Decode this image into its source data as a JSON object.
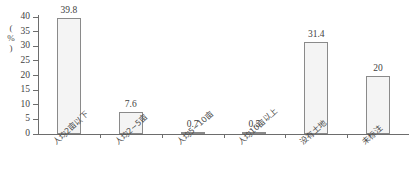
{
  "chart_data": {
    "type": "bar",
    "title": "",
    "subtitle": "",
    "xlabel": "",
    "ylabel": "(%)",
    "ylim": [
      0,
      40
    ],
    "ytick_labels": [
      "40",
      "35",
      "30",
      "25",
      "20",
      "15",
      "10",
      "5",
      "0"
    ],
    "ytick_values": [
      40,
      35,
      30,
      25,
      20,
      15,
      10,
      5,
      0
    ],
    "ytick_step": 5,
    "grid": false,
    "legend": false,
    "legend_position": "none",
    "categories": [
      "人均2亩以下",
      "人均2~5亩",
      "人均5~10亩",
      "人均10亩以上",
      "没有土地",
      "未标注"
    ],
    "values": [
      39.8,
      7.6,
      0.7,
      0.5,
      31.4,
      20
    ],
    "value_labels": [
      "39.8",
      "7.6",
      "0.7",
      "0.5",
      "31.4",
      "20"
    ],
    "bar_fill_color": "#f4f4f4",
    "bar_border_color": "#8a8a8a",
    "axis_color": "#6d6d6d",
    "text_color": "#3f3f3f",
    "background_color": "#ffffff"
  }
}
